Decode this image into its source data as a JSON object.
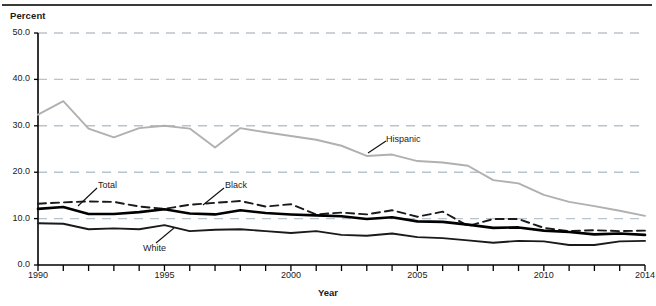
{
  "axis": {
    "y_title": "Percent",
    "x_title": "Year",
    "y_ticks": [
      "0.0",
      "10.0",
      "20.0",
      "30.0",
      "40.0",
      "50.0"
    ],
    "x_ticks": [
      "1990",
      "1995",
      "2000",
      "2005",
      "2010",
      "2014"
    ]
  },
  "labels": {
    "hispanic": "Hispanic",
    "total": "Total",
    "black": "Black",
    "white": "White"
  },
  "colors": {
    "hispanic": "#b0b0b0",
    "total": "#000000",
    "black": "#1a1a1a",
    "white": "#1a1a1a",
    "gridline": "#b9c3cc",
    "axis": "#000000"
  },
  "chart_data": {
    "type": "line",
    "title": "",
    "xlabel": "Year",
    "ylabel": "Percent",
    "xlim": [
      1990,
      2014
    ],
    "ylim": [
      0.0,
      50.0
    ],
    "grid": true,
    "grid_axis": "y",
    "legend": "inline-annotations",
    "x": [
      1990,
      1991,
      1992,
      1993,
      1994,
      1995,
      1996,
      1997,
      1998,
      1999,
      2000,
      2001,
      2002,
      2003,
      2004,
      2005,
      2006,
      2007,
      2008,
      2009,
      2010,
      2011,
      2012,
      2013,
      2014
    ],
    "series": [
      {
        "name": "Hispanic",
        "style": "solid",
        "color": "#b0b0b0",
        "values": [
          32.4,
          35.3,
          29.4,
          27.5,
          29.5,
          30.0,
          29.4,
          25.3,
          29.5,
          28.6,
          27.8,
          27.0,
          25.7,
          23.5,
          23.8,
          22.4,
          22.1,
          21.4,
          18.3,
          17.6,
          15.1,
          13.6,
          12.7,
          11.7,
          10.6
        ]
      },
      {
        "name": "Black",
        "style": "dashed",
        "color": "#1a1a1a",
        "values": [
          13.2,
          13.5,
          13.7,
          13.6,
          12.6,
          12.1,
          13.0,
          13.4,
          13.8,
          12.6,
          13.1,
          10.9,
          11.3,
          10.9,
          11.8,
          10.4,
          11.5,
          8.4,
          9.9,
          9.9,
          8.0,
          7.3,
          7.5,
          7.3,
          7.4
        ]
      },
      {
        "name": "Total",
        "style": "solid-thick",
        "color": "#000000",
        "values": [
          12.1,
          12.5,
          11.0,
          11.0,
          11.4,
          12.0,
          11.1,
          10.9,
          11.8,
          11.2,
          10.9,
          10.7,
          10.5,
          9.9,
          10.3,
          9.4,
          9.3,
          8.7,
          8.0,
          8.1,
          7.4,
          7.1,
          6.6,
          6.8,
          6.5
        ]
      },
      {
        "name": "White",
        "style": "solid",
        "color": "#1a1a1a",
        "values": [
          9.0,
          8.9,
          7.7,
          7.9,
          7.7,
          8.6,
          7.3,
          7.6,
          7.7,
          7.3,
          6.9,
          7.3,
          6.5,
          6.3,
          6.8,
          6.0,
          5.8,
          5.3,
          4.8,
          5.2,
          5.1,
          4.3,
          4.3,
          5.1,
          5.2
        ]
      }
    ]
  }
}
